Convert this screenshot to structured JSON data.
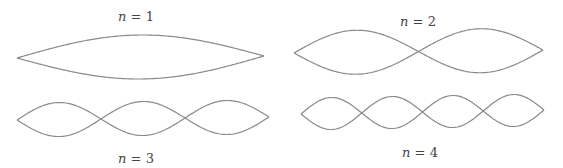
{
  "colors": {
    "stroke": "#8a8a8a",
    "text": "#444444",
    "background": "#ffffff"
  },
  "modes": [
    {
      "n": 1,
      "label_var": "n",
      "label_rest": " = 1",
      "x0": 17,
      "y0": 58,
      "x1": 264,
      "y1": 56,
      "amplitude": 22,
      "label_x": 136,
      "label_y": 16
    },
    {
      "n": 2,
      "label_var": "n",
      "label_rest": " = 2",
      "x0": 294,
      "y0": 53,
      "x1": 543,
      "y1": 50,
      "amplitude": 22,
      "label_x": 418,
      "label_y": 21
    },
    {
      "n": 3,
      "label_var": "n",
      "label_rest": " = 3",
      "x0": 17,
      "y0": 120,
      "x1": 269,
      "y1": 117,
      "amplitude": 17,
      "label_x": 136,
      "label_y": 158
    },
    {
      "n": 4,
      "label_var": "n",
      "label_rest": " = 4",
      "x0": 301,
      "y0": 114,
      "x1": 544,
      "y1": 110,
      "amplitude": 16,
      "label_x": 420,
      "label_y": 152
    }
  ]
}
